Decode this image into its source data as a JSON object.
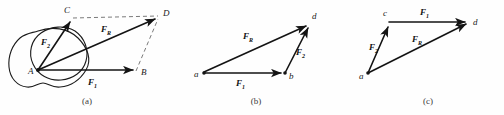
{
  "figure": {
    "background_color": "#fefefe",
    "line_color": "#141414",
    "dashed_color": "#6b6b6b",
    "panels": [
      {
        "id": "a",
        "caption": "(a)",
        "points": [
          {
            "name": "A",
            "label": "A"
          },
          {
            "name": "B",
            "label": "B"
          },
          {
            "name": "C",
            "label": "C"
          },
          {
            "name": "D",
            "label": "D"
          }
        ],
        "vectors": [
          {
            "name": "F1",
            "base": "F",
            "sub": "1",
            "from": "A",
            "to": "B"
          },
          {
            "name": "F2",
            "base": "F",
            "sub": "2",
            "from": "A",
            "to": "C"
          },
          {
            "name": "FR",
            "base": "F",
            "sub": "R",
            "from": "A",
            "to": "D"
          }
        ],
        "construction_lines": [
          {
            "from": "C",
            "to": "D",
            "style": "dashed"
          },
          {
            "from": "B",
            "to": "D",
            "style": "dashed"
          }
        ],
        "has_body_outline": true
      },
      {
        "id": "b",
        "caption": "(b)",
        "points": [
          {
            "name": "a",
            "label": "a"
          },
          {
            "name": "b",
            "label": "b"
          },
          {
            "name": "d",
            "label": "d"
          }
        ],
        "vectors": [
          {
            "name": "F1",
            "base": "F",
            "sub": "1",
            "from": "a",
            "to": "b"
          },
          {
            "name": "F2",
            "base": "F",
            "sub": "2",
            "from": "b",
            "to": "d"
          },
          {
            "name": "FR",
            "base": "F",
            "sub": "R",
            "from": "a",
            "to": "d"
          }
        ],
        "construction_lines": [],
        "has_body_outline": false
      },
      {
        "id": "c",
        "caption": "(c)",
        "points": [
          {
            "name": "a",
            "label": "a"
          },
          {
            "name": "c",
            "label": "c"
          },
          {
            "name": "d",
            "label": "d"
          }
        ],
        "vectors": [
          {
            "name": "F2",
            "base": "F",
            "sub": "2",
            "from": "a",
            "to": "c"
          },
          {
            "name": "F1",
            "base": "F",
            "sub": "1",
            "from": "c",
            "to": "d"
          },
          {
            "name": "FR",
            "base": "F",
            "sub": "R",
            "from": "a",
            "to": "d"
          }
        ],
        "construction_lines": [],
        "has_body_outline": false
      }
    ]
  }
}
